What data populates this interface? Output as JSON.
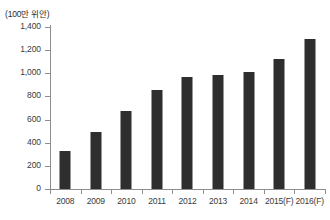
{
  "chart_data": {
    "type": "bar",
    "title": "",
    "subtitle": "",
    "unit_caption": "(100만 위안)",
    "xlabel": "",
    "ylabel": "",
    "categories": [
      "2008",
      "2009",
      "2010",
      "2011",
      "2012",
      "2013",
      "2014",
      "2015(F)",
      "2016(F)"
    ],
    "values": [
      325,
      490,
      675,
      860,
      970,
      985,
      1010,
      1120,
      1295
    ],
    "series": [
      {
        "name": "",
        "values": [
          325,
          490,
          675,
          860,
          970,
          985,
          1010,
          1120,
          1295
        ]
      }
    ],
    "ylim": [
      0,
      1400
    ],
    "ytick_values": [
      0,
      200,
      400,
      600,
      800,
      1000,
      1200,
      1400
    ],
    "ytick_labels": [
      "0",
      "200",
      "400",
      "600",
      "800",
      "1,000",
      "1,200",
      "1,400"
    ],
    "grid": false,
    "legend": false,
    "legend_position": "none",
    "bar_color": "#2e2e2e",
    "axis_color": "#8d8d8d",
    "text_color": "#3a3a3a",
    "background_color": "#ffffff",
    "annotations": []
  }
}
